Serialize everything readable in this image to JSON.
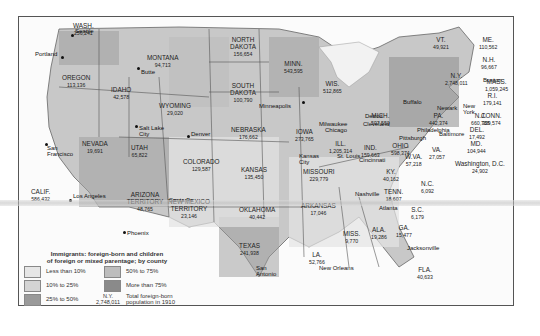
{
  "map": {
    "title": "Immigrants: foreign-born and children of foreign or mixed parentage; by county",
    "legend": {
      "title_line1": "Immigrants: foreign-born and children",
      "title_line2": "of foreign or mixed parentage; by county",
      "items": [
        {
          "label": "Less than 10%",
          "color": "#e6e6e6"
        },
        {
          "label": "10% to 25%",
          "color": "#d4d4d4"
        },
        {
          "label": "25% to 50%",
          "color": "#9a9a9a"
        },
        {
          "label": "50% to 75%",
          "color": "#bdbdbd"
        },
        {
          "label": "More than 75%",
          "color": "#8a8a8a"
        }
      ],
      "sample_state": "N.Y.",
      "sample_value": "2,748,011",
      "sample_desc_line1": "Total foreign-born",
      "sample_desc_line2": "population in 1910"
    },
    "states": [
      {
        "name": "WASH.",
        "value": "256,241"
      },
      {
        "name": "OREGON",
        "value": "113,136"
      },
      {
        "name": "CALIF.",
        "value": "586,432"
      },
      {
        "name": "IDAHO",
        "value": "42,578"
      },
      {
        "name": "NEVADA",
        "value": "19,691"
      },
      {
        "name": "MONTANA",
        "value": "94,713"
      },
      {
        "name": "WYOMING",
        "value": "29,020"
      },
      {
        "name": "UTAH",
        "value": "65,822"
      },
      {
        "name": "COLORADO",
        "value": "129,587"
      },
      {
        "name": "ARIZONA TERRITORY",
        "value": "48,765"
      },
      {
        "name": "NEW MEXICO TERRITORY",
        "value": "23,146"
      },
      {
        "name": "NORTH DAKOTA",
        "value": "156,654"
      },
      {
        "name": "SOUTH DAKOTA",
        "value": "100,790"
      },
      {
        "name": "NEBRASKA",
        "value": "176,662"
      },
      {
        "name": "KANSAS",
        "value": "135,450"
      },
      {
        "name": "OKLAHOMA",
        "value": "40,442"
      },
      {
        "name": "TEXAS",
        "value": "241,938"
      },
      {
        "name": "MINN.",
        "value": "543,595"
      },
      {
        "name": "IOWA",
        "value": "273,765"
      },
      {
        "name": "MISSOURI",
        "value": "229,779"
      },
      {
        "name": "ARKANSAS",
        "value": "17,046"
      },
      {
        "name": "LA.",
        "value": "52,766"
      },
      {
        "name": "WIS.",
        "value": "512,865"
      },
      {
        "name": "ILL.",
        "value": "1,205,314"
      },
      {
        "name": "MICH.",
        "value": "597,550"
      },
      {
        "name": "IND.",
        "value": "159,663"
      },
      {
        "name": "OHIO",
        "value": "598,374"
      },
      {
        "name": "KY.",
        "value": "40,162"
      },
      {
        "name": "TENN.",
        "value": "18,607"
      },
      {
        "name": "MISS.",
        "value": "9,770"
      },
      {
        "name": "ALA.",
        "value": "19,286"
      },
      {
        "name": "GA.",
        "value": "15,477"
      },
      {
        "name": "FLA.",
        "value": "40,633"
      },
      {
        "name": "S.C.",
        "value": "6,179"
      },
      {
        "name": "N.C.",
        "value": "6,092"
      },
      {
        "name": "VA.",
        "value": "27,057"
      },
      {
        "name": "W.VA.",
        "value": "57,218"
      },
      {
        "name": "MD.",
        "value": "104,944"
      },
      {
        "name": "DEL.",
        "value": "17,492"
      },
      {
        "name": "Washington, D.C.",
        "value": "24,902"
      },
      {
        "name": "PA.",
        "value": "442,374"
      },
      {
        "name": "N.J.",
        "value": "660,788"
      },
      {
        "name": "N.Y.",
        "value": "2,748,011"
      },
      {
        "name": "CONN.",
        "value": "329,574"
      },
      {
        "name": "R.I.",
        "value": "179,141"
      },
      {
        "name": "MASS.",
        "value": "1,059,245"
      },
      {
        "name": "VT.",
        "value": "49,921"
      },
      {
        "name": "N.H.",
        "value": "96,667"
      },
      {
        "name": "ME.",
        "value": "110,562"
      }
    ],
    "cities": [
      "Seattle",
      "Portland",
      "Butte",
      "San Francisco",
      "Los Angeles",
      "Salt Lake City",
      "Denver",
      "Phoenix",
      "Santa Fe",
      "Minneapolis",
      "Milwaukee",
      "Chicago",
      "Kansas City",
      "St. Louis",
      "Detroit",
      "Cleveland",
      "Cincinnati",
      "Buffalo",
      "Pittsburgh",
      "Philadelphia",
      "New York",
      "Newark",
      "Boston",
      "Baltimore",
      "Nashville",
      "Atlanta",
      "New Orleans",
      "San Antonio",
      "Jacksonville"
    ]
  }
}
